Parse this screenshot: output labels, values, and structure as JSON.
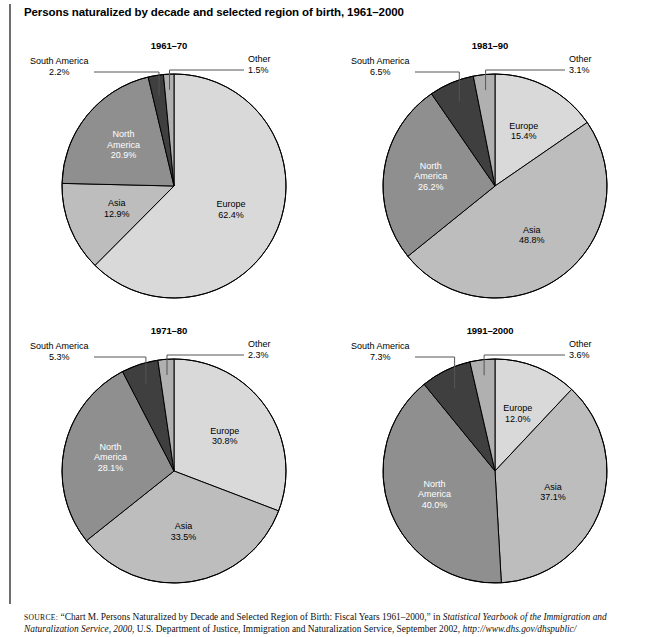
{
  "figure": {
    "title": "Persons naturalized by decade and selected region of birth, 1961–2000"
  },
  "source": {
    "label": "SOURCE:",
    "text_1": " “Chart M. Persons Naturalized by Decade and Selected Region of Birth: Fiscal Years 1961–2000,” in ",
    "italic_1": "Statistical Yearbook of the Immigration and Naturalization Service, 2000",
    "text_2": ", U.S. Department of Justice, Immigration and Naturalization Service, September 2002, ",
    "italic_2": "http://www.dhs.gov/dhspublic/"
  },
  "palette": {
    "europe": "#d9d9d9",
    "asia": "#bdbdbd",
    "north_america": "#8f8f8f",
    "south_america": "#3f3f3f",
    "other": "#b0b0b0",
    "stroke": "#000000",
    "leader": "#555555"
  },
  "chart_data": [
    {
      "type": "pie",
      "title": "1961–70",
      "categories": [
        "Europe",
        "Asia",
        "North America",
        "South America",
        "Other"
      ],
      "values": [
        62.4,
        12.9,
        20.9,
        2.2,
        1.5
      ],
      "labels": [
        "62.4%",
        "12.9%",
        "20.9%",
        "2.2%",
        "1.5%"
      ],
      "start_angle_deg": 0,
      "direction": "clockwise",
      "callouts": [
        "South America",
        "Other"
      ],
      "inside_labels": [
        "Europe",
        "Asia",
        "North America"
      ]
    },
    {
      "type": "pie",
      "title": "1981–90",
      "categories": [
        "Europe",
        "Asia",
        "North America",
        "South America",
        "Other"
      ],
      "values": [
        15.4,
        48.8,
        26.2,
        6.5,
        3.1
      ],
      "labels": [
        "15.4%",
        "48.8%",
        "26.2%",
        "6.5%",
        "3.1%"
      ],
      "start_angle_deg": 0,
      "direction": "clockwise",
      "callouts": [
        "South America",
        "Other"
      ],
      "inside_labels": [
        "Europe",
        "Asia",
        "North America"
      ]
    },
    {
      "type": "pie",
      "title": "1971–80",
      "categories": [
        "Europe",
        "Asia",
        "North America",
        "South America",
        "Other"
      ],
      "values": [
        30.8,
        33.5,
        28.1,
        5.3,
        2.3
      ],
      "labels": [
        "30.8%",
        "33.5%",
        "28.1%",
        "5.3%",
        "2.3%"
      ],
      "start_angle_deg": 0,
      "direction": "clockwise",
      "callouts": [
        "South America",
        "Other"
      ],
      "inside_labels": [
        "Europe",
        "Asia",
        "North America"
      ]
    },
    {
      "type": "pie",
      "title": "1991–2000",
      "categories": [
        "Europe",
        "Asia",
        "North America",
        "South America",
        "Other"
      ],
      "values": [
        12.0,
        37.1,
        40.0,
        7.3,
        3.6
      ],
      "labels": [
        "12.0%",
        "37.1%",
        "40.0%",
        "7.3%",
        "3.6%"
      ],
      "start_angle_deg": 0,
      "direction": "clockwise",
      "callouts": [
        "South America",
        "Other"
      ],
      "inside_labels": [
        "Europe",
        "Asia",
        "North America"
      ]
    }
  ],
  "charts": [
    {
      "title": "1961–70",
      "callout_sa": {
        "name": "South America",
        "value": "2.2%"
      },
      "callout_other": {
        "name": "Other",
        "value": "1.5%"
      },
      "europe": {
        "name": "Europe",
        "value": "62.4%"
      },
      "asia": {
        "name": "Asia",
        "value": "12.9%"
      },
      "na_line1": "North",
      "na_line2": "America",
      "na_value": "20.9%"
    },
    {
      "title": "1981–90",
      "callout_sa": {
        "name": "South America",
        "value": "6.5%"
      },
      "callout_other": {
        "name": "Other",
        "value": "3.1%"
      },
      "europe": {
        "name": "Europe",
        "value": "15.4%"
      },
      "asia": {
        "name": "Asia",
        "value": "48.8%"
      },
      "na_line1": "North",
      "na_line2": "America",
      "na_value": "26.2%"
    },
    {
      "title": "1971–80",
      "callout_sa": {
        "name": "South America",
        "value": "5.3%"
      },
      "callout_other": {
        "name": "Other",
        "value": "2.3%"
      },
      "europe": {
        "name": "Europe",
        "value": "30.8%"
      },
      "asia": {
        "name": "Asia",
        "value": "33.5%"
      },
      "na_line1": "North",
      "na_line2": "America",
      "na_value": "28.1%"
    },
    {
      "title": "1991–2000",
      "callout_sa": {
        "name": "South America",
        "value": "7.3%"
      },
      "callout_other": {
        "name": "Other",
        "value": "3.6%"
      },
      "europe": {
        "name": "Europe",
        "value": "12.0%"
      },
      "asia": {
        "name": "Asia",
        "value": "37.1%"
      },
      "na_line1": "North",
      "na_line2": "America",
      "na_value": "40.0%"
    }
  ]
}
